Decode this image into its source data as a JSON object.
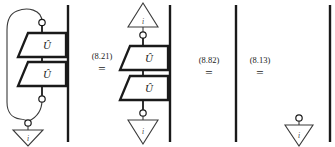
{
  "figure": {
    "type": "string-diagram-equation-chain",
    "background_color": "#ffffff",
    "ink_color": "#1a1a1a",
    "box_label": "Û",
    "triangle_label": "i",
    "equations": [
      {
        "number": "(8.21)",
        "relation": "="
      },
      {
        "number": "(8.82)",
        "relation": "="
      },
      {
        "number": "(8.13)",
        "relation": "="
      }
    ],
    "panels": [
      {
        "name": "left-hand-side",
        "description": "Two stacked Û boxes on a wire with a feedback loop from the top dot around the left side down to the bottom dot, terminating in a discard triangle labelled i; a separate straight wire on the right.",
        "elements": [
          "feedback-loop",
          "top-dot",
          "u-box-upper",
          "u-box-lower",
          "bottom-dot",
          "loop-join-dot",
          "discard-triangle",
          "straight-wire"
        ]
      },
      {
        "name": "second-panel",
        "description": "State triangle labelled i on top, dot, two stacked Û boxes, dot, discard triangle labelled i below; a separate straight wire on the right.",
        "elements": [
          "state-triangle",
          "top-dot",
          "u-box-upper",
          "u-box-lower",
          "bottom-dot",
          "discard-triangle",
          "straight-wire"
        ]
      },
      {
        "name": "third-panel",
        "description": "A single bare straight vertical wire.",
        "elements": [
          "straight-wire"
        ]
      },
      {
        "name": "fourth-panel",
        "description": "A dot with a discard triangle labelled i, plus a separate straight vertical wire at the far right.",
        "elements": [
          "dot",
          "discard-triangle",
          "straight-wire"
        ]
      }
    ]
  }
}
